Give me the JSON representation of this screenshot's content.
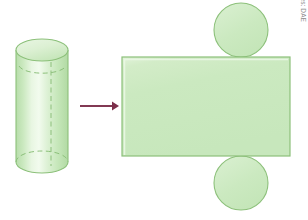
{
  "figure": {
    "background_color": "#ffffff",
    "credit": "Ilustrações: DAE",
    "credit_color": "#8d8d8d",
    "palette": {
      "shape_fill": "#cbe9c0",
      "shape_fill_light": "#e4f4de",
      "shape_fill_highlight": "#eff9ea",
      "shape_stroke": "#8cc07a",
      "dashed_stroke": "#8cc07a",
      "arrow_color": "#7c2f4a"
    },
    "solid": {
      "label": "cylinder",
      "center_x": 42,
      "top_y": 50,
      "bottom_y": 162,
      "radius_x": 26,
      "radius_y": 11,
      "seam_x": 51
    },
    "arrow": {
      "label": "transforms-into",
      "x_start": 80,
      "x_end": 118,
      "y": 106,
      "color": "#7c2f4a"
    },
    "net": {
      "label": "cylinder net",
      "rectangle": {
        "name": "lateral-surface-rectangle",
        "x": 122,
        "y": 57,
        "width": 168,
        "height": 99
      },
      "circle_top": {
        "name": "top-base-circle",
        "cx": 241,
        "cy": 30,
        "r": 27
      },
      "circle_bottom": {
        "name": "bottom-base-circle",
        "cx": 241,
        "cy": 183,
        "r": 27
      }
    }
  }
}
